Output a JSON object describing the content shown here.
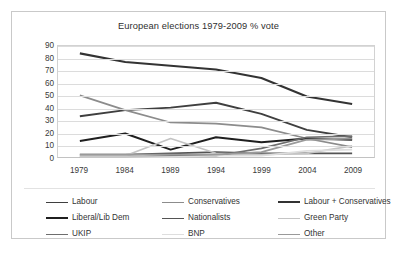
{
  "chart_data": {
    "type": "line",
    "title": "European elections 1979-2009 % vote",
    "xlabel": "",
    "ylabel": "",
    "categories": [
      "1979",
      "1984",
      "1989",
      "1994",
      "1999",
      "2004",
      "2009"
    ],
    "ylim": [
      0,
      90
    ],
    "ytick_step": 10,
    "yticks": [
      "90",
      "80",
      "70",
      "60",
      "50",
      "40",
      "30",
      "20",
      "10",
      "0"
    ],
    "grid": "horizontal",
    "legend_position": "bottom",
    "legend_columns": 3,
    "series": [
      {
        "name": "Labour",
        "color": "#3f3f3f",
        "width": 1.9,
        "values": [
          33,
          38,
          40,
          44,
          35,
          22,
          16
        ]
      },
      {
        "name": "Conservatives",
        "color": "#8c8c8c",
        "width": 1.7,
        "values": [
          50,
          38,
          28,
          27,
          24,
          15,
          8
        ]
      },
      {
        "name": "Labour + Conservatives",
        "color": "#333333",
        "width": 2.1,
        "values": [
          84,
          77,
          74,
          71,
          64,
          49,
          43
        ]
      },
      {
        "name": "Liberal/Lib Dem",
        "color": "#1f1f1f",
        "width": 2.0,
        "values": [
          13,
          19,
          6,
          16,
          12,
          15,
          14
        ]
      },
      {
        "name": "Nationalists",
        "color": "#545454",
        "width": 1.7,
        "values": [
          2,
          2,
          3,
          4,
          3,
          3,
          3
        ]
      },
      {
        "name": "Green Party",
        "color": "#c4c4c4",
        "width": 1.7,
        "values": [
          1,
          1,
          15,
          3,
          2,
          3,
          9
        ]
      },
      {
        "name": "UKIP",
        "color": "#6e6e6e",
        "width": 1.7,
        "values": [
          0,
          0,
          1,
          1,
          7,
          16,
          17
        ]
      },
      {
        "name": "BNP",
        "color": "#dedede",
        "width": 1.7,
        "values": [
          0,
          0,
          0,
          1,
          1,
          5,
          6
        ]
      },
      {
        "name": "Other",
        "color": "#9a9a9a",
        "width": 1.8,
        "values": [
          2,
          2,
          2,
          2,
          4,
          14,
          15
        ]
      }
    ]
  }
}
